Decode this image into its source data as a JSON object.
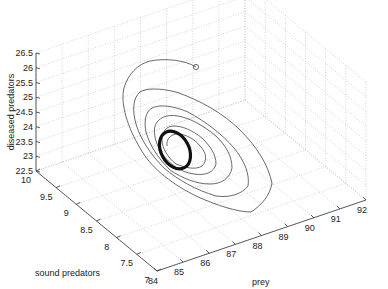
{
  "chart_data": {
    "type": "line",
    "subtype": "3d-phase-trajectory",
    "title": "",
    "axes": {
      "x": {
        "label": "prey",
        "ticks": [
          84,
          85,
          86,
          87,
          88,
          89,
          90,
          91,
          92
        ],
        "range": [
          84,
          92
        ]
      },
      "y": {
        "label": "sound predators",
        "ticks": [
          7,
          7.5,
          8,
          8.5,
          9,
          9.5,
          10
        ],
        "range": [
          7,
          10
        ]
      },
      "z": {
        "label": "diseased predators",
        "ticks": [
          22.5,
          23,
          23.5,
          24,
          24.5,
          25,
          25.5,
          26,
          26.5
        ],
        "range": [
          22.5,
          26.5
        ]
      }
    },
    "grid": true,
    "legend": null,
    "series": [
      {
        "name": "trajectory",
        "description": "Damped spiral starting near (prey≈87, sound≈9.5, diseased≈26) marked with a circle, converging to a limit cycle near (prey≈86.5, sound≈9, diseased≈24).",
        "start_marker": "circle",
        "start_point": {
          "prey": 87.0,
          "sound_predators": 9.5,
          "diseased_predators": 26.0
        },
        "limit_cycle_center": {
          "prey": 86.5,
          "sound_predators": 9.0,
          "diseased_predators": 24.0
        }
      }
    ]
  },
  "labels": {
    "x_axis": "prey",
    "y_axis": "sound predators",
    "z_axis": "diseased predators",
    "x_ticks": [
      "84",
      "85",
      "86",
      "87",
      "88",
      "89",
      "90",
      "91",
      "92"
    ],
    "y_ticks": [
      "10",
      "9.5",
      "9",
      "8.5",
      "8",
      "7.5",
      "7"
    ],
    "z_ticks": [
      "26.5",
      "26",
      "25.5",
      "25",
      "24.5",
      "24",
      "23.5",
      "23",
      "22.5"
    ]
  }
}
